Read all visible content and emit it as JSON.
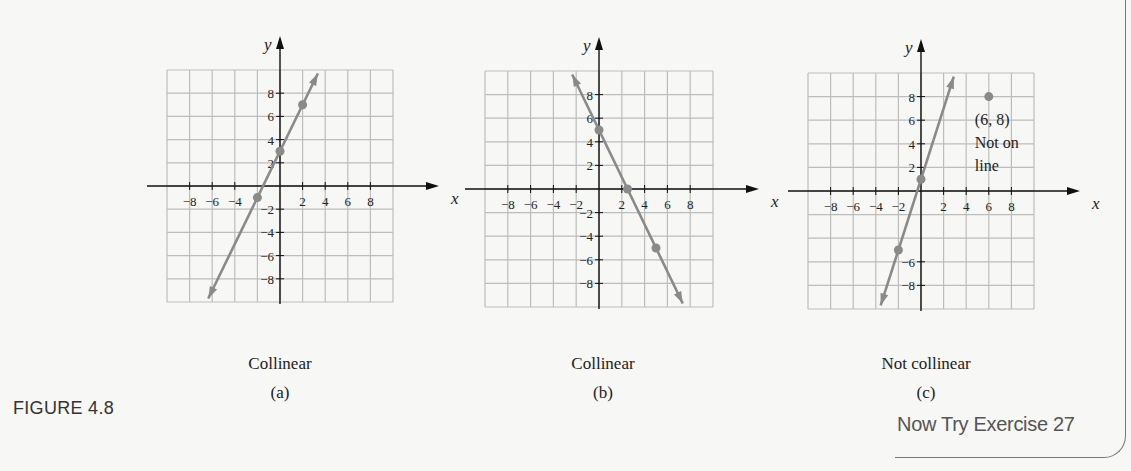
{
  "figure": {
    "label": "FIGURE 4.8",
    "exercise_link": "Now Try Exercise 27"
  },
  "colors": {
    "grid": "#bdbdbd",
    "axis": "#111111",
    "line": "#8a8a8a",
    "point": "#8a8a8a",
    "text": "#222222"
  },
  "graphs": [
    {
      "id": "a",
      "caption": "Collinear",
      "sublabel": "(a)",
      "x_axis_label": "x",
      "y_axis_label": "y",
      "x_tick_labels": [
        "−8",
        "−6",
        "−4",
        "2",
        "4",
        "6",
        "8"
      ],
      "y_tick_labels": [
        "8",
        "6",
        "4",
        "2",
        "−2",
        "−4",
        "−6",
        "−8"
      ]
    },
    {
      "id": "b",
      "caption": "Collinear",
      "sublabel": "(b)",
      "x_axis_label": "x",
      "y_axis_label": "y",
      "x_tick_labels": [
        "−8",
        "−6",
        "−4",
        "−2",
        "2",
        "4",
        "6",
        "8"
      ],
      "y_tick_labels": [
        "8",
        "6",
        "4",
        "2",
        "−2",
        "−4",
        "−6",
        "−8"
      ]
    },
    {
      "id": "c",
      "caption": "Not collinear",
      "sublabel": "(c)",
      "x_axis_label": "x",
      "y_axis_label": "y",
      "x_tick_labels": [
        "−8",
        "−6",
        "−4",
        "−2",
        "2",
        "4",
        "6",
        "8"
      ],
      "y_tick_labels": [
        "8",
        "6",
        "4",
        "2",
        "−6",
        "−8"
      ],
      "annotation": {
        "point_label": "(6, 8)",
        "line1": "Not on",
        "line2": "line"
      }
    }
  ],
  "chart_data": [
    {
      "type": "scatter",
      "title": "Collinear (a)",
      "xlabel": "x",
      "ylabel": "y",
      "xlim": [
        -10,
        10
      ],
      "ylim": [
        -10,
        10
      ],
      "grid": true,
      "grid_step": 2,
      "points": [
        [
          -2,
          -1
        ],
        [
          0,
          3
        ],
        [
          2,
          7
        ]
      ],
      "line": {
        "slope": 2,
        "intercept": 3
      }
    },
    {
      "type": "scatter",
      "title": "Collinear (b)",
      "xlabel": "x",
      "ylabel": "y",
      "xlim": [
        -10,
        10
      ],
      "ylim": [
        -10,
        10
      ],
      "grid": true,
      "grid_step": 2,
      "points": [
        [
          0,
          5
        ],
        [
          2.5,
          0
        ],
        [
          5,
          -5
        ]
      ],
      "line": {
        "slope": -2,
        "intercept": 5
      }
    },
    {
      "type": "scatter",
      "title": "Not collinear (c)",
      "xlabel": "x",
      "ylabel": "y",
      "xlim": [
        -10,
        10
      ],
      "ylim": [
        -10,
        10
      ],
      "grid": true,
      "grid_step": 2,
      "points": [
        [
          -2,
          -5
        ],
        [
          0,
          1
        ],
        [
          6,
          8
        ]
      ],
      "line": {
        "slope": 3,
        "intercept": 1
      },
      "annotations": [
        {
          "x": 6,
          "y": 8,
          "text": "(6, 8) Not on line"
        }
      ]
    }
  ]
}
